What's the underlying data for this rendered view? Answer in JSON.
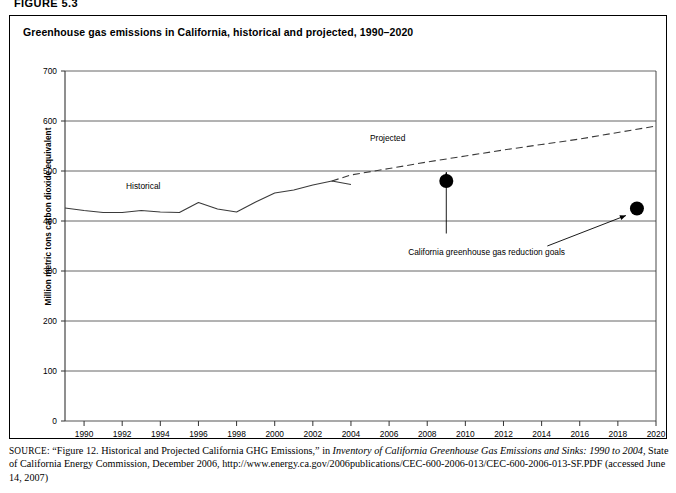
{
  "figure": {
    "number_label": "FIGURE 5.3",
    "title": "Greenhouse gas emissions in California, historical and projected, 1990–2020"
  },
  "source": {
    "label": "SOURCE:",
    "line1_pre": " “Figure 12. Historical and Projected California GHG Emissions,” in ",
    "line1_italic": "Inventory of California Greenhouse Gas Emissions and Sinks: 1990 to 2004,",
    "line2": " State of California Energy Commission, December 2006, http://www.energy.ca.gov/2006publications/CEC-600-2006-013/CEC-600-2006-013-SF.PDF (accessed June 14, 2007)"
  },
  "chart_data": {
    "type": "line",
    "title": "Greenhouse gas emissions in California, historical and projected, 1990–2020",
    "xlabel": "",
    "ylabel": "Million metric tons carbon dioxide equivalent",
    "xlim": [
      1989,
      2020
    ],
    "ylim": [
      0,
      700
    ],
    "ytick_values": [
      0,
      100,
      200,
      300,
      400,
      500,
      600,
      700
    ],
    "ytick_labels": [
      "0",
      "100",
      "200",
      "300",
      "400",
      "500",
      "600",
      "700"
    ],
    "xtick_values": [
      1990,
      1992,
      1994,
      1996,
      1998,
      2000,
      2002,
      2004,
      2006,
      2008,
      2010,
      2012,
      2014,
      2016,
      2018,
      2020
    ],
    "xtick_labels": [
      "1990",
      "1992",
      "1994",
      "1996",
      "1998",
      "2000",
      "2002",
      "2004",
      "2006",
      "2008",
      "2010",
      "2012",
      "2014",
      "2016",
      "2018",
      "2020"
    ],
    "grid": "horizontal",
    "legend_position": "inline-annotations",
    "series": [
      {
        "name": "Historical",
        "style": "solid",
        "x": [
          1989,
          1990,
          1991,
          1992,
          1993,
          1994,
          1995,
          1996,
          1997,
          1998,
          1999,
          2000,
          2001,
          2002,
          2003,
          2004
        ],
        "values": [
          426,
          421,
          417,
          417,
          421,
          418,
          417,
          437,
          424,
          418,
          438,
          456,
          462,
          472,
          480,
          473
        ]
      },
      {
        "name": "Projected",
        "style": "dashed",
        "x": [
          2003,
          2004,
          2006,
          2008,
          2010,
          2012,
          2014,
          2016,
          2018,
          2020
        ],
        "values": [
          480,
          492,
          505,
          518,
          530,
          542,
          553,
          564,
          577,
          590
        ]
      }
    ],
    "points": [
      {
        "name": "2010 reduction goal",
        "x": 2009,
        "y": 480,
        "marker": "filled-circle"
      },
      {
        "name": "2020 reduction goal",
        "x": 2019,
        "y": 425,
        "marker": "filled-circle"
      }
    ],
    "annotations": [
      {
        "name": "historical-label",
        "text": "Historical",
        "x": 1992.2,
        "y": 465
      },
      {
        "name": "projected-label",
        "text": "Projected",
        "x": 2005.0,
        "y": 560
      },
      {
        "name": "goals-label",
        "text": "California greenhouse gas reduction goals",
        "x": 2007.0,
        "y": 333
      }
    ]
  },
  "colors": {
    "line": "#3a3a3a",
    "grid": "#555555",
    "axis": "#333333",
    "marker": "#000000",
    "text": "#000000",
    "background": "#ffffff"
  }
}
